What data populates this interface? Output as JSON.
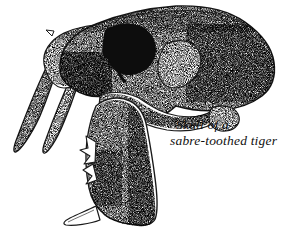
{
  "figure": {
    "name": "skull-line-drawing",
    "subject": "Skull of a sabre-toothed tiger",
    "medium": "stippled pen-and-ink scientific illustration",
    "background_color": "#ffffff",
    "ink_color": "#1a1a1a",
    "orientation": "left-facing lateral view"
  },
  "caption": {
    "line1": "Skull of a",
    "line2": "sabre-toothed tiger"
  },
  "anatomy": {
    "parts": [
      {
        "label": "cranium",
        "name": "cranium-shape"
      },
      {
        "label": "orbit",
        "name": "orbit-socket"
      },
      {
        "label": "temporal fenestra",
        "name": "temporal-fenestra"
      },
      {
        "label": "zygomatic arch",
        "name": "zygomatic-arch"
      },
      {
        "label": "upper sabre canine",
        "name": "sabre-canine-front"
      },
      {
        "label": "second sabre canine",
        "name": "sabre-canine-back"
      },
      {
        "label": "mandible",
        "name": "mandible-shape"
      },
      {
        "label": "mandible teeth",
        "name": "mandible-teeth"
      },
      {
        "label": "occipital condyle",
        "name": "occipital-condyle"
      },
      {
        "label": "premaxilla teeth",
        "name": "premaxilla-teeth"
      }
    ]
  }
}
